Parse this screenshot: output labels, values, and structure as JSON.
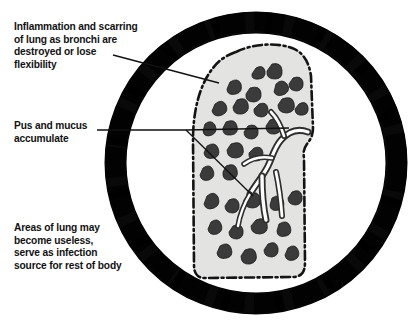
{
  "figure": {
    "background_color": "#ffffff",
    "ring": {
      "name": "circular-frame",
      "color": "#000000",
      "center_x": 256,
      "center_y": 163,
      "outer_radius": 152,
      "band_thickness": 23
    },
    "lung": {
      "name": "lung-cross-section",
      "fill_color": "#e3e3e1",
      "outline_color": "#111111",
      "outline_style": "dash-dot",
      "lesion_color": "#3a3a3a",
      "lesion_count": 38,
      "description": "Lung cross-section with scattered dark lesions and branching bronchial passages"
    }
  },
  "callouts": [
    {
      "id": "inflammation",
      "lines": "Inflammation and scarring\nof lung as bronchi are\ndestroyed or lose\nflexibility",
      "leader": "diagonal-down-right"
    },
    {
      "id": "pus",
      "lines": "Pus and mucus\naccumulate",
      "leader": "horizontal-forked"
    },
    {
      "id": "areas",
      "lines": "Areas of lung may\nbecome useless,\nserve as infection\nsource for rest of body",
      "leader": "none"
    }
  ],
  "colors": {
    "ink": "#121212",
    "frame": "#000000",
    "tissue": "#e3e3e1",
    "lesion": "#3a3a3a",
    "paper": "#ffffff"
  }
}
